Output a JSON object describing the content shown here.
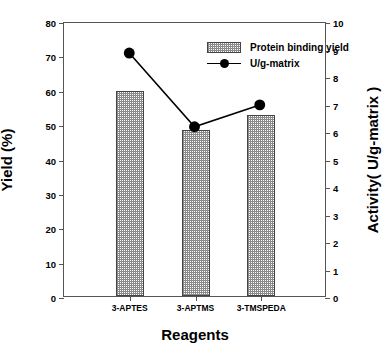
{
  "chart_data": {
    "type": "bar",
    "title": "",
    "subtitle": "",
    "xlabel": "Reagents",
    "ylabel": "Yield (%)",
    "y2label": "Activity( U/g-matrix )",
    "categories": [
      "3-APTES",
      "3-APTMS",
      "3-TMSPEDA"
    ],
    "ylim": [
      0,
      80
    ],
    "yticks": [
      0,
      10,
      20,
      30,
      40,
      50,
      60,
      70,
      80
    ],
    "ytick_labels": [
      "0",
      "10",
      "20",
      "30",
      "40",
      "50",
      "60",
      "70",
      "80"
    ],
    "y2lim": [
      0,
      10
    ],
    "y2ticks": [
      0,
      1,
      2,
      3,
      4,
      5,
      6,
      7,
      8,
      9,
      10
    ],
    "y2tick_labels": [
      "0",
      "1",
      "2",
      "3",
      "4",
      "5",
      "6",
      "7",
      "8",
      "9",
      "10"
    ],
    "grid": false,
    "legend_position": "top-center",
    "series": [
      {
        "name": "Protein binding yield",
        "type": "bar",
        "axis": "left",
        "values": [
          59.7,
          48.2,
          52.8
        ],
        "fill": "crosshatch-dotted",
        "edge_color": "#444444",
        "fill_color": "#8a8a8a"
      },
      {
        "name": "U/g-matrix",
        "type": "line",
        "axis": "right",
        "values": [
          8.9,
          6.2,
          7.0
        ],
        "marker": "filled-circle",
        "line_color": "#000000",
        "marker_color": "#000000"
      }
    ]
  },
  "legend": {
    "items": [
      {
        "label": "Protein binding yield",
        "key": "hatched-swatch"
      },
      {
        "label": "U/g-matrix",
        "key": "line-with-circle-marker"
      }
    ]
  },
  "axes": {
    "left_title": "Yield (%)",
    "right_title": "Activity( U/g-matrix )",
    "bottom_title": "Reagents"
  },
  "colors": {
    "frame": "#555555",
    "bar_edge": "#444444",
    "bar_hatch": "#8a8a8a",
    "line": "#000000",
    "background": "#ffffff"
  }
}
